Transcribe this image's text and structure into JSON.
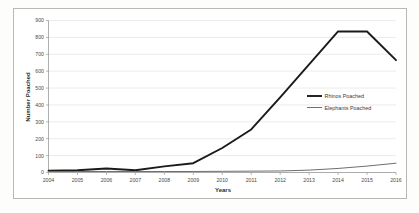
{
  "chart_data": {
    "type": "line",
    "title": "",
    "xlabel": "Years",
    "ylabel": "Number Poached",
    "categories": [
      "2004",
      "2005",
      "2006",
      "2007",
      "2008",
      "2009",
      "2010",
      "2011",
      "2012",
      "2013",
      "2014",
      "2015",
      "2016"
    ],
    "x": [
      2004,
      2005,
      2006,
      2007,
      2008,
      2009,
      2010,
      2011,
      2012,
      2013,
      2014,
      2015,
      2016
    ],
    "xlim": [
      2004,
      2016
    ],
    "ylim": [
      0,
      900
    ],
    "yticks": [
      0,
      100,
      200,
      300,
      400,
      500,
      600,
      700,
      800,
      900
    ],
    "ytick_labels": [
      "0",
      "100",
      "200",
      "300",
      "400",
      "500",
      "600",
      "700",
      "800",
      "900"
    ],
    "grid": true,
    "legend_position": "center-right",
    "series": [
      {
        "name": "Rhinos Poached",
        "color": "#1a1a1a",
        "width": 1.9,
        "values": [
          10,
          13,
          24,
          13,
          36,
          55,
          145,
          255,
          445,
          640,
          835,
          835,
          665
        ]
      },
      {
        "name": "Elephants Poached",
        "color": "#6f6f6f",
        "width": 1.0,
        "values": [
          6,
          6,
          6,
          6,
          6,
          6,
          7,
          8,
          9,
          14,
          24,
          38,
          55
        ]
      }
    ]
  },
  "legend": {
    "items": [
      {
        "label": "Rhinos Poached"
      },
      {
        "label": "Elephants Poached"
      }
    ]
  },
  "axes": {
    "y_title": "Number Poached",
    "x_title": "Years"
  },
  "colors": {
    "rhinos": "#1a1a1a",
    "elephants": "#6f6f6f",
    "grid": "#e2e2e0",
    "axis": "#9a9a95",
    "frame": "#b9b9b4",
    "background": "#ffffff"
  }
}
